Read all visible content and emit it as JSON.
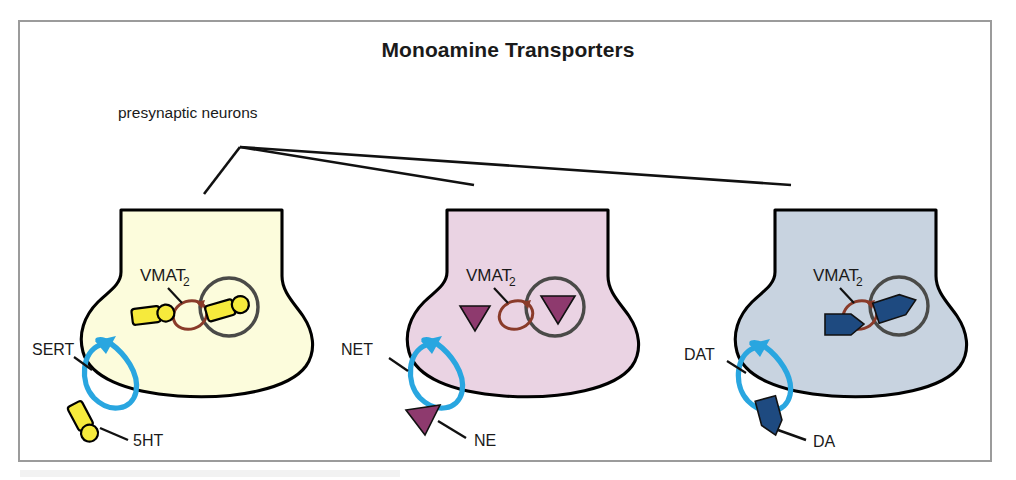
{
  "figure": {
    "title": "Monoamine Transporters",
    "annotation_label": "presynaptic neurons",
    "frame_border_color": "#9b9b9b",
    "background_color": "#ffffff"
  },
  "shared": {
    "vesicle_transporter_label": "VMAT",
    "vesicle_transporter_subscript": "2",
    "vesicle_outline_color": "#4a4a48",
    "vmat_loop_color": "#8a3b2a",
    "reuptake_loop_color": "#29a6e0",
    "terminal_outline_color": "#000000"
  },
  "terminals": [
    {
      "id": "serotonin-terminal",
      "membrane_transporter_label": "SERT",
      "neurotransmitter_label": "5HT",
      "neurotransmitter_name": "serotonin",
      "terminal_fill": "#fcfcdc",
      "molecule_fill": "#f6ea3c",
      "molecule_shape": "rounded-rect-with-circle"
    },
    {
      "id": "norepinephrine-terminal",
      "membrane_transporter_label": "NET",
      "neurotransmitter_label": "NE",
      "neurotransmitter_name": "norepinephrine",
      "terminal_fill": "#ead3e3",
      "molecule_fill": "#8e3a6e",
      "molecule_shape": "triangle"
    },
    {
      "id": "dopamine-terminal",
      "membrane_transporter_label": "DAT",
      "neurotransmitter_label": "DA",
      "neurotransmitter_name": "dopamine",
      "terminal_fill": "#c8d3e0",
      "molecule_fill": "#1e4a80",
      "molecule_shape": "pentagon-arrow"
    }
  ]
}
